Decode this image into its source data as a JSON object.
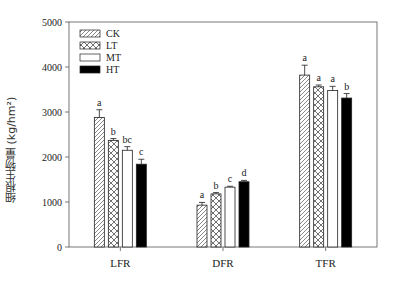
{
  "chart_data": {
    "type": "bar",
    "title": "",
    "xlabel": "",
    "ylabel": "细根生物量 (kg/hm²)",
    "ylim": [
      0,
      5000
    ],
    "yticks": [
      0,
      1000,
      2000,
      3000,
      4000,
      5000
    ],
    "categories": [
      "LFR",
      "DFR",
      "TFR"
    ],
    "grid": false,
    "legend_position": "upper-left",
    "series": [
      {
        "name": "CK",
        "pattern": "diagonal-hatch",
        "values": [
          2880,
          930,
          3820
        ],
        "errors": [
          170,
          60,
          220
        ],
        "letters": [
          "a",
          "a",
          "a"
        ]
      },
      {
        "name": "LT",
        "pattern": "cross-hatch",
        "values": [
          2370,
          1180,
          3560
        ],
        "errors": [
          40,
          30,
          40
        ],
        "letters": [
          "b",
          "b",
          "a"
        ]
      },
      {
        "name": "MT",
        "pattern": "white",
        "values": [
          2150,
          1330,
          3480
        ],
        "errors": [
          80,
          20,
          90
        ],
        "letters": [
          "bc",
          "c",
          "a"
        ]
      },
      {
        "name": "HT",
        "pattern": "black",
        "values": [
          1840,
          1450,
          3310
        ],
        "errors": [
          110,
          30,
          100
        ],
        "letters": [
          "c",
          "d",
          "b"
        ]
      }
    ]
  }
}
